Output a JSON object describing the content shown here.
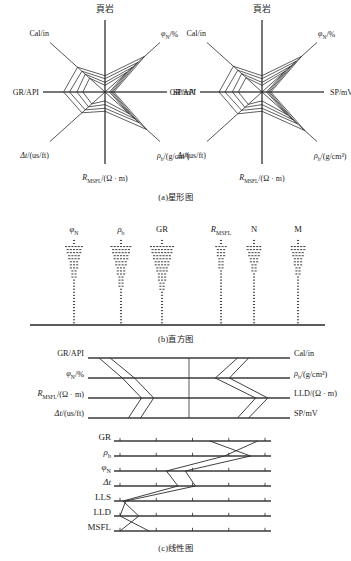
{
  "figure": {
    "panels": [
      {
        "id": "a",
        "caption": "(a)星形图",
        "type": "star-glyph",
        "charts": [
          {
            "title": "頁岩",
            "axis_labels": [
              {
                "text": "頁岩",
                "pos": "N"
              },
              {
                "text": "φ",
                "sub": "N",
                "unit": "/%",
                "pos": "NE"
              },
              {
                "text": "SP/mV",
                "pos": "E"
              },
              {
                "text": "ρ",
                "sub": "b",
                "unit": "/(g/cm³)",
                "pos": "SE"
              },
              {
                "text": "R",
                "sub": "MSFL",
                "unit": "/(Ω · m)",
                "pos": "S"
              },
              {
                "text": "Δt",
                "unit": "/(us/ft)",
                "pos": "SW"
              },
              {
                "text": "GR/API",
                "pos": "W"
              },
              {
                "text": "Cal/in",
                "pos": "NW"
              }
            ],
            "series": [
              {
                "name": "curve-1",
                "values": [
                  0.22,
                  0.72,
                  0.12,
                  0.76,
                  0.26,
                  0.42,
                  0.56,
                  0.5
                ]
              },
              {
                "name": "curve-2",
                "values": [
                  0.18,
                  0.6,
                  0.1,
                  0.62,
                  0.22,
                  0.36,
                  0.48,
                  0.42
                ]
              },
              {
                "name": "curve-3",
                "values": [
                  0.13,
                  0.5,
                  0.08,
                  0.54,
                  0.17,
                  0.3,
                  0.38,
                  0.36
                ]
              },
              {
                "name": "curve-4",
                "values": [
                  0.09,
                  0.4,
                  0.06,
                  0.44,
                  0.12,
                  0.24,
                  0.3,
                  0.28
                ]
              }
            ]
          },
          {
            "title": "頁岩",
            "axis_labels": [
              {
                "text": "頁岩",
                "pos": "N"
              },
              {
                "text": "φ",
                "sub": "N",
                "unit": "/%",
                "pos": "NE"
              },
              {
                "text": "SP/mV",
                "pos": "E"
              },
              {
                "text": "ρ",
                "sub": "b",
                "unit": "/(g/cm³)",
                "pos": "SE"
              },
              {
                "text": "R",
                "sub": "MSFL",
                "unit": "/(Ω · m)",
                "pos": "S"
              },
              {
                "text": "Δt",
                "unit": "/(us/ft)",
                "pos": "SW"
              },
              {
                "text": "GR/API",
                "pos": "W"
              },
              {
                "text": "Cal/in",
                "pos": "NW"
              }
            ],
            "series": [
              {
                "name": "curve-1",
                "values": [
                  0.22,
                  0.72,
                  0.12,
                  0.78,
                  0.26,
                  0.44,
                  0.58,
                  0.52
                ]
              },
              {
                "name": "curve-2",
                "values": [
                  0.18,
                  0.62,
                  0.1,
                  0.64,
                  0.22,
                  0.37,
                  0.5,
                  0.44
                ]
              },
              {
                "name": "curve-3",
                "values": [
                  0.13,
                  0.52,
                  0.08,
                  0.56,
                  0.17,
                  0.31,
                  0.4,
                  0.37
                ]
              },
              {
                "name": "curve-4",
                "values": [
                  0.09,
                  0.42,
                  0.06,
                  0.46,
                  0.12,
                  0.25,
                  0.32,
                  0.29
                ]
              }
            ]
          }
        ]
      },
      {
        "id": "b",
        "caption": "(b)直方图",
        "type": "histogram",
        "columns": [
          {
            "label": "φ",
            "sub": "N",
            "x": 74,
            "widths": [
              1,
              1,
              1,
              1,
              1,
              1,
              1,
              1,
              1,
              1,
              1,
              1,
              1,
              1,
              1,
              2,
              2,
              2,
              3,
              3,
              3,
              4,
              4,
              5,
              5,
              6
            ]
          },
          {
            "label": "ρ",
            "sub": "b",
            "x": 121,
            "widths": [
              1,
              1,
              1,
              1,
              1,
              1,
              1,
              1,
              1,
              1,
              1,
              1,
              2,
              2,
              2,
              2,
              3,
              3,
              3,
              4,
              4,
              5,
              5,
              6,
              6,
              7
            ]
          },
          {
            "label": "GR",
            "sub": "",
            "x": 162,
            "widths": [
              1,
              1,
              1,
              1,
              1,
              1,
              1,
              1,
              1,
              1,
              1,
              2,
              2,
              2,
              3,
              3,
              3,
              4,
              4,
              5,
              5,
              6,
              6,
              7,
              7,
              8
            ]
          },
          {
            "label": "R",
            "sub": "MSFL",
            "x": 221,
            "widths": [
              1,
              1,
              1,
              1,
              1,
              1,
              1,
              1,
              1,
              1,
              1,
              1,
              1,
              1,
              1,
              1,
              1,
              1,
              2,
              2,
              2,
              2,
              3,
              3,
              3,
              4
            ]
          },
          {
            "label": "N",
            "sub": "",
            "x": 254,
            "widths": [
              1,
              1,
              1,
              1,
              1,
              1,
              1,
              1,
              1,
              1,
              1,
              1,
              1,
              1,
              1,
              1,
              1,
              2,
              2,
              2,
              3,
              3,
              4,
              4,
              5,
              5
            ]
          },
          {
            "label": "M",
            "sub": "",
            "x": 298,
            "widths": [
              1,
              1,
              1,
              1,
              1,
              1,
              1,
              1,
              1,
              1,
              1,
              1,
              1,
              1,
              1,
              1,
              2,
              2,
              2,
              3,
              3,
              3,
              4,
              4,
              5,
              5
            ]
          }
        ],
        "baseline_y": 325
      },
      {
        "id": "c",
        "caption": "(c)线性图",
        "type": "parallel-horizontal",
        "left_labels": [
          {
            "text": "GR/API"
          },
          {
            "text": "φ",
            "sub": "N",
            "unit": "/%"
          },
          {
            "text": "R",
            "sub": "MSFL",
            "unit": "/(Ω · m)"
          },
          {
            "text": "Δt",
            "unit": "/(us/ft)"
          }
        ],
        "right_labels": [
          {
            "text": "Cal/in"
          },
          {
            "text": "ρ",
            "sub": "b",
            "unit": "/(g/cm³)"
          },
          {
            "text": "LLD/(Ω · m)"
          },
          {
            "text": "SP/mV"
          }
        ],
        "axes_y": [
          8,
          28,
          48,
          68
        ],
        "x_range": [
          88,
          290
        ],
        "center_x": 189,
        "left_series": [
          {
            "name": "L1",
            "values": [
              0.11,
              0.34,
              0.53,
              0.4
            ]
          },
          {
            "name": "L2",
            "values": [
              0.22,
              0.46,
              0.65,
              0.52
            ]
          }
        ],
        "right_series": [
          {
            "name": "R1",
            "values": [
              0.41,
              0.6,
              0.22,
              0.41
            ]
          },
          {
            "name": "R2",
            "values": [
              0.52,
              0.74,
              0.34,
              0.52
            ]
          }
        ]
      },
      {
        "id": "d",
        "caption": "(c)线性图",
        "type": "parallel-coordinates",
        "axis_labels": [
          "GR",
          "ρ b",
          "φ N",
          "Δt",
          "LLS",
          "LLD",
          "MSFL"
        ],
        "axis_rows": [
          {
            "label": "GR",
            "sub": "",
            "italic": false
          },
          {
            "label": "ρ",
            "sub": "b",
            "italic": true
          },
          {
            "label": "φ",
            "sub": "N",
            "italic": true
          },
          {
            "label": "Δt",
            "sub": "",
            "italic": true
          },
          {
            "label": "LLS",
            "sub": "",
            "italic": false
          },
          {
            "label": "LLD",
            "sub": "",
            "italic": false
          },
          {
            "label": "MSFL",
            "sub": "",
            "italic": false
          }
        ],
        "axes_y": [
          16,
          31,
          46,
          61,
          76,
          91,
          106
        ],
        "x_range": [
          120,
          265
        ],
        "ticks_per_axis": 5,
        "series": [
          {
            "name": "S1",
            "values": [
              0.62,
              0.9,
              0.45,
              0.52,
              0.04,
              0.0,
              0.2
            ]
          },
          {
            "name": "S2",
            "values": [
              0.95,
              0.72,
              0.32,
              0.4,
              0.02,
              0.13,
              0.0
            ]
          }
        ]
      }
    ]
  }
}
